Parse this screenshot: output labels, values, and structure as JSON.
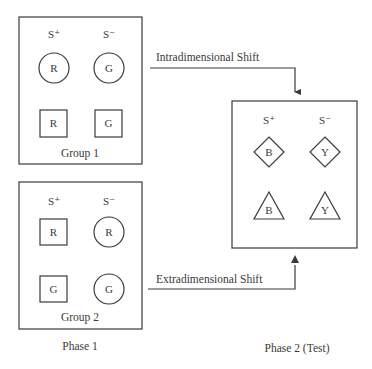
{
  "diagram": {
    "type": "discrimination-shift-design",
    "phases": {
      "phase1_label": "Phase 1",
      "phase2_label": "Phase 2 (Test)"
    },
    "column_headers": {
      "positive": "S⁺",
      "negative": "S⁻"
    },
    "groups": [
      {
        "name": "Group 1",
        "rows": [
          {
            "s_plus": {
              "shape": "circle",
              "letter": "R"
            },
            "s_minus": {
              "shape": "circle",
              "letter": "G"
            }
          },
          {
            "s_plus": {
              "shape": "square",
              "letter": "R"
            },
            "s_minus": {
              "shape": "square",
              "letter": "G"
            }
          }
        ]
      },
      {
        "name": "Group 2",
        "rows": [
          {
            "s_plus": {
              "shape": "square",
              "letter": "R"
            },
            "s_minus": {
              "shape": "circle",
              "letter": "R"
            }
          },
          {
            "s_plus": {
              "shape": "square",
              "letter": "G"
            },
            "s_minus": {
              "shape": "circle",
              "letter": "G"
            }
          }
        ]
      }
    ],
    "test": {
      "rows": [
        {
          "s_plus": {
            "shape": "diamond",
            "letter": "B"
          },
          "s_minus": {
            "shape": "diamond",
            "letter": "Y"
          }
        },
        {
          "s_plus": {
            "shape": "triangle",
            "letter": "B"
          },
          "s_minus": {
            "shape": "triangle",
            "letter": "Y"
          }
        }
      ]
    },
    "arrows": {
      "intra": "Intradimensional Shift",
      "extra": "Extradimensional Shift"
    },
    "colors": {
      "ink": "#3a3a3a",
      "background": "#ffffff"
    }
  }
}
